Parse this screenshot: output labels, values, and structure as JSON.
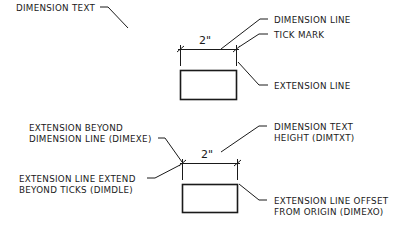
{
  "top_diagram": {
    "dimension_value": "2\"",
    "labels": {
      "dimension_text": "DIMENSION TEXT",
      "dimension_line": "DIMENSION LINE",
      "tick_mark": "TICK MARK",
      "extension_line": "EXTENSION LINE"
    }
  },
  "bottom_diagram": {
    "dimension_value": "2\"",
    "labels": {
      "dimexe_line1": "EXTENSION BEYOND",
      "dimexe_line2": "DIMENSION LINE (DIMEXE)",
      "dimdle_line1": "EXTENSION LINE EXTEND",
      "dimdle_line2": "BEYOND TICKS (DIMDLE)",
      "dimtxt_line1": "DIMENSION TEXT",
      "dimtxt_line2": "HEIGHT (DIMTXT)",
      "dimexo_line1": "EXTENSION LINE OFFSET",
      "dimexo_line2": "FROM ORIGIN (DIMEXO)"
    }
  },
  "colors": {
    "ink": "#1a1a1a",
    "background": "#ffffff"
  }
}
